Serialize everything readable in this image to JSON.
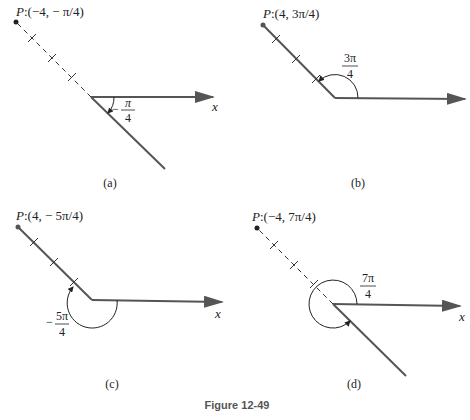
{
  "figure_caption": "Figure 12-49",
  "panels": [
    {
      "id": "a",
      "caption": "(a)",
      "point_label_prefix": "P",
      "point_label": ":(−4, − π/4)",
      "angle_label": {
        "sign": "−",
        "numerator": "π",
        "denominator": "4"
      },
      "axis_label": "x",
      "ray_style": "dashed-to-P",
      "radius": -4,
      "angle": "-π/4"
    },
    {
      "id": "b",
      "caption": "(b)",
      "point_label_prefix": "P",
      "point_label": ":(4,  3π/4)",
      "angle_label": {
        "sign": "",
        "numerator": "3π",
        "denominator": "4"
      },
      "axis_label": "",
      "ray_style": "solid-to-P",
      "radius": 4,
      "angle": "3π/4"
    },
    {
      "id": "c",
      "caption": "(c)",
      "point_label_prefix": "P",
      "point_label": ":(4, − 5π/4)",
      "angle_label": {
        "sign": "−",
        "numerator": "5π",
        "denominator": "4"
      },
      "axis_label": "x",
      "ray_style": "solid-to-P",
      "radius": 4,
      "angle": "-5π/4"
    },
    {
      "id": "d",
      "caption": "(d)",
      "point_label_prefix": "P",
      "point_label": ":(−4,  7π/4)",
      "angle_label": {
        "sign": "",
        "numerator": "7π",
        "denominator": "4"
      },
      "axis_label": "x",
      "ray_style": "dashed-to-P",
      "radius": -4,
      "angle": "7π/4"
    }
  ],
  "colors": {
    "line": "#555555",
    "text": "#222222",
    "caption": "#555555"
  }
}
